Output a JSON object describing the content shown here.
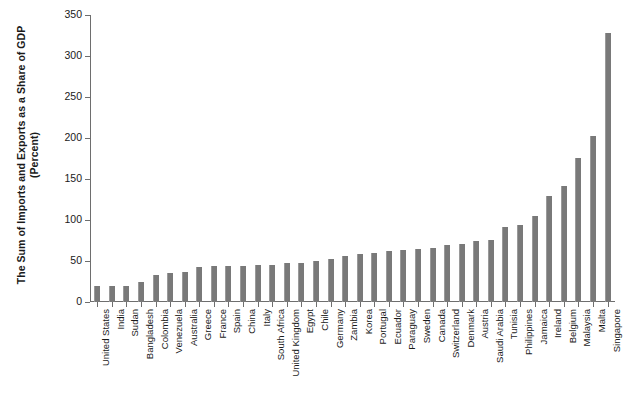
{
  "chart_data": {
    "type": "bar",
    "title": "",
    "subtitle": "",
    "xlabel": "",
    "ylabel": "The Sum of Imports and Exports as a Share of GDP (Percent)",
    "ylabel_line1": "The Sum of Imports and Exports as a Share of GDP",
    "ylabel_line2": "(Percent)",
    "ylim": [
      0,
      350
    ],
    "yticks": [
      0,
      50,
      100,
      150,
      200,
      250,
      300,
      350
    ],
    "ytick_labels": [
      "0",
      "50",
      "100",
      "150",
      "200",
      "250",
      "300",
      "350"
    ],
    "grid": false,
    "legend": null,
    "bar_color": "#797979",
    "axis_color": "#6e6e6e",
    "background_color": "#ffffff",
    "categories": [
      "United States",
      "India",
      "Sudan",
      "Bangladesh",
      "Colombia",
      "Venezuela",
      "Australia",
      "Greece",
      "France",
      "Spain",
      "China",
      "Italy",
      "South Africa",
      "United Kingdom",
      "Egypt",
      "Chile",
      "Germany",
      "Zambia",
      "Korea",
      "Portugal",
      "Ecuador",
      "Paraguay",
      "Sweden",
      "Canada",
      "Switzerland",
      "Denmark",
      "Austria",
      "Saudi Arabia",
      "Tunisia",
      "Philippines",
      "Jamaica",
      "Ireland",
      "Belgium",
      "Malaysia",
      "Malta",
      "Singapore"
    ],
    "values": [
      20,
      20,
      20,
      25,
      33,
      35,
      37,
      43,
      44,
      44,
      44,
      45,
      45,
      47,
      48,
      50,
      52,
      56,
      58,
      60,
      62,
      63,
      65,
      66,
      69,
      71,
      75,
      76,
      91,
      94,
      105,
      129,
      142,
      176,
      203,
      328
    ],
    "value_unit": "percent"
  }
}
